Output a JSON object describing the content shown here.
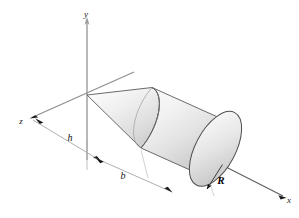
{
  "figure": {
    "kind": "engineering-solid-of-revolution-diagram",
    "background_color": "#ffffff",
    "outline_color": "#3a3a3a",
    "axis_color": "#8a8a8a",
    "dimension_color": "#9a9a9a",
    "arrow_color": "#1a1a1a",
    "shade_light": "#f4f4f4",
    "shade_mid": "#dcdcdc",
    "shade_dark": "#b8b8b8"
  },
  "axes": [
    {
      "name": "y-axis",
      "label": "y",
      "direction": "up",
      "label_x": 86,
      "label_y": 17
    },
    {
      "name": "x-axis",
      "label": "x",
      "direction": "lower-right",
      "label_x": 289,
      "label_y": 202
    },
    {
      "name": "z-axis",
      "label": "z",
      "direction": "lower-left",
      "label_x": 21,
      "label_y": 123
    }
  ],
  "dimensions": [
    {
      "name": "cone-height",
      "label": "h",
      "label_x": 70,
      "label_y": 141,
      "style": "italic"
    },
    {
      "name": "cylinder-length",
      "label": "b",
      "label_x": 123,
      "label_y": 178,
      "style": "italic"
    },
    {
      "name": "cylinder-radius",
      "label": "R",
      "label_x": 219,
      "label_y": 183,
      "style": "bold-italic"
    }
  ],
  "solids": [
    {
      "name": "cone",
      "apex": "origin",
      "axis": "x"
    },
    {
      "name": "cylinder",
      "axis": "x",
      "radius_label": "R",
      "length_label": "b"
    }
  ]
}
